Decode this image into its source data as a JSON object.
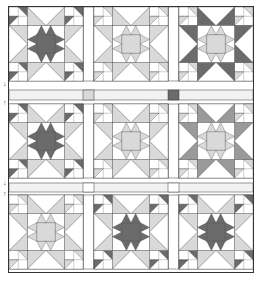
{
  "diagram": {
    "colors": {
      "outline": "#333333",
      "dark": "#6b6b6b",
      "medium": "#9a9a9a",
      "light": "#d9d9d9",
      "background": "#ffffff",
      "sashing": "#f2f2f2"
    },
    "grid": {
      "rows": 3,
      "columns": 3
    },
    "blocks": [
      {
        "row": 1,
        "col": 1,
        "center": "dark",
        "star_points": "light",
        "corner_stars": "dark"
      },
      {
        "row": 1,
        "col": 2,
        "center": "light",
        "star_points": "light",
        "corner_stars": "light"
      },
      {
        "row": 1,
        "col": 3,
        "center": "light",
        "star_points": "dark",
        "corner_stars": "light"
      },
      {
        "row": 2,
        "col": 1,
        "center": "dark",
        "star_points": "light",
        "corner_stars": "dark"
      },
      {
        "row": 2,
        "col": 2,
        "center": "light",
        "star_points": "light",
        "corner_stars": "light"
      },
      {
        "row": 2,
        "col": 3,
        "center": "light",
        "star_points": "medium",
        "corner_stars": "light"
      },
      {
        "row": 3,
        "col": 1,
        "center": "light",
        "star_points": "light",
        "corner_stars": "light"
      },
      {
        "row": 3,
        "col": 2,
        "center": "dark",
        "star_points": "light",
        "corner_stars": "dark"
      },
      {
        "row": 3,
        "col": 3,
        "center": "dark",
        "star_points": "light",
        "corner_stars": "dark"
      }
    ],
    "sashing": {
      "cornerstones": [
        {
          "position": "row1-col1",
          "shade": "light"
        },
        {
          "position": "row1-col2",
          "shade": "dark"
        }
      ]
    },
    "markers": [
      "arrow-down",
      "arrow-up",
      "arrow-down",
      "arrow-up"
    ]
  }
}
